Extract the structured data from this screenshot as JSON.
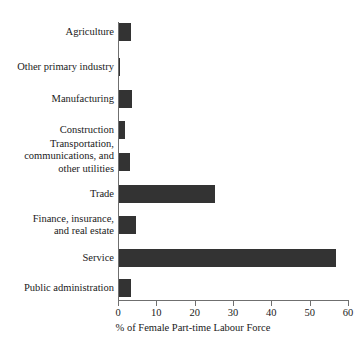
{
  "chart_data": {
    "type": "bar",
    "orientation": "horizontal",
    "title": "",
    "subtitle": "",
    "xlabel": "% of Female Part-time Labour Force",
    "ylabel": "",
    "xlim": [
      0,
      60
    ],
    "xticks": [
      0,
      10,
      20,
      30,
      40,
      50,
      60
    ],
    "xtick_labels": [
      "0",
      "10",
      "20",
      "30",
      "40",
      "50",
      "60"
    ],
    "grid": false,
    "legend": null,
    "bar_color": "#333333",
    "axis_color": "#6f6f6f",
    "background_color": "#ffffff",
    "categories": [
      "Agriculture",
      "Other primary industry",
      "Manufacturing",
      "Construction",
      "Transportation,\ncommunications, and\nother utilities",
      "Trade",
      "Finance, insurance,\nand real estate",
      "Service",
      "Public administration"
    ],
    "values": [
      3.2,
      0.2,
      3.5,
      1.6,
      2.9,
      25.0,
      4.4,
      56.5,
      3.2
    ]
  },
  "rows": [
    {
      "label": "Agriculture",
      "value": 3.2,
      "top": 23,
      "label_top": 26
    },
    {
      "label": "Other primary industry",
      "value": 0.2,
      "top": 58,
      "label_top": 61
    },
    {
      "label": "Manufacturing",
      "value": 3.5,
      "top": 90,
      "label_top": 93
    },
    {
      "label": "Construction",
      "value": 1.6,
      "top": 121,
      "label_top": 124
    },
    {
      "label": "Transportation,\ncommunications, and\nother utilities",
      "value": 2.9,
      "top": 153,
      "label_top": 138
    },
    {
      "label": "Trade",
      "value": 25.0,
      "top": 185,
      "label_top": 188
    },
    {
      "label": "Finance, insurance,\nand real estate",
      "value": 4.4,
      "top": 216,
      "label_top": 213
    },
    {
      "label": "Service",
      "value": 56.5,
      "top": 249,
      "label_top": 252
    },
    {
      "label": "Public administration",
      "value": 3.2,
      "top": 279,
      "label_top": 282
    }
  ],
  "axis": {
    "title": "% of Female Part-time Labour Force"
  }
}
